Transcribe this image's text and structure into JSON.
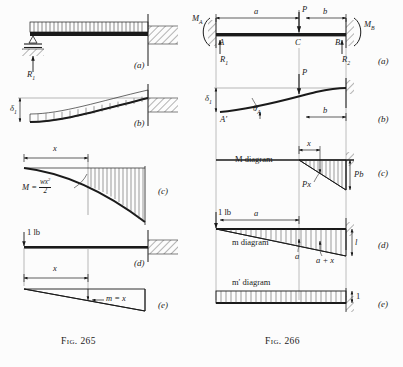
{
  "page": {
    "background_color": "#fcfcfc",
    "ink_color": "#1a1a1a"
  },
  "figures": [
    {
      "id": "fig-265",
      "caption": "Fig. 265",
      "panels": [
        {
          "key": "a",
          "label": "(a)",
          "description": "propped cantilever with uniform distributed load",
          "annotations": [
            {
              "name": "reaction-r1",
              "text": "R",
              "sub": "1"
            }
          ]
        },
        {
          "key": "b",
          "label": "(b)",
          "description": "deflection curve of cantilever under uniform load",
          "annotations": [
            {
              "name": "deflection-delta1",
              "text": "δ",
              "sub": "1"
            }
          ]
        },
        {
          "key": "c",
          "label": "(c)",
          "description": "bending moment diagram for uniform load",
          "annotations": [
            {
              "name": "distance-x",
              "text": "x"
            },
            {
              "name": "moment-equation-lhs",
              "text": "M ="
            },
            {
              "name": "moment-equation-numerator",
              "text": "wx²"
            },
            {
              "name": "moment-equation-denominator",
              "text": "2"
            }
          ]
        },
        {
          "key": "d",
          "label": "(d)",
          "description": "cantilever with unit load at free end",
          "annotations": [
            {
              "name": "unit-load",
              "text": "1 lb"
            }
          ]
        },
        {
          "key": "e",
          "label": "(e)",
          "description": "unit-load moment diagram, triangular",
          "annotations": [
            {
              "name": "distance-x",
              "text": "x"
            },
            {
              "name": "unit-moment",
              "text": "m = x"
            }
          ]
        }
      ]
    },
    {
      "id": "fig-266",
      "caption": "Fig. 266",
      "panels": [
        {
          "key": "a",
          "label": "(a)",
          "description": "fixed-fixed beam with concentrated load P at C",
          "annotations": [
            {
              "name": "moment-ma",
              "text": "M",
              "sub": "A"
            },
            {
              "name": "moment-mb",
              "text": "M",
              "sub": "B"
            },
            {
              "name": "span-a",
              "text": "a"
            },
            {
              "name": "span-b",
              "text": "b"
            },
            {
              "name": "load-p",
              "text": "P"
            },
            {
              "name": "node-a",
              "text": "A"
            },
            {
              "name": "node-c",
              "text": "C"
            },
            {
              "name": "node-b",
              "text": "B"
            },
            {
              "name": "reaction-r1",
              "text": "R",
              "sub": "1"
            },
            {
              "name": "reaction-r2",
              "text": "R",
              "sub": "2"
            }
          ]
        },
        {
          "key": "b",
          "label": "(b)",
          "description": "deflected shape with end rotation",
          "annotations": [
            {
              "name": "deflection-delta1",
              "text": "δ",
              "sub": "1"
            },
            {
              "name": "rotation-theta-a",
              "text": "θ",
              "sub": "A"
            },
            {
              "name": "node-a-prime",
              "text": "A′"
            },
            {
              "name": "load-p",
              "text": "P"
            },
            {
              "name": "span-b",
              "text": "b"
            }
          ]
        },
        {
          "key": "c",
          "label": "(c)",
          "description": "M diagram for the applied load P",
          "annotations": [
            {
              "name": "diagram-title",
              "text": "M diagram"
            },
            {
              "name": "distance-x",
              "text": "x"
            },
            {
              "name": "ordinate-px",
              "text": "Px"
            },
            {
              "name": "ordinate-pb",
              "text": "Pb"
            }
          ]
        },
        {
          "key": "d",
          "label": "(d)",
          "description": "m diagram for a unit load at the left end",
          "annotations": [
            {
              "name": "diagram-title",
              "text": "m diagram"
            },
            {
              "name": "unit-load",
              "text": "1 lb"
            },
            {
              "name": "span-a",
              "text": "a"
            },
            {
              "name": "ordinate-a",
              "text": "a"
            },
            {
              "name": "ordinate-a-plus-x",
              "text": "a + x"
            },
            {
              "name": "span-l",
              "text": "l"
            }
          ]
        },
        {
          "key": "e",
          "label": "(e)",
          "description": "m-prime diagram, uniform unit ordinate",
          "annotations": [
            {
              "name": "diagram-title",
              "text": "m′ diagram"
            },
            {
              "name": "ordinate-unit",
              "text": "1"
            }
          ]
        }
      ]
    }
  ]
}
